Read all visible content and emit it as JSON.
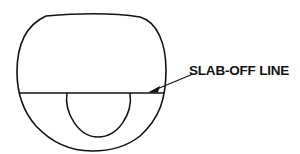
{
  "diagram": {
    "labels": {
      "slab_off_line": "SLAB-OFF LINE"
    },
    "colors": {
      "stroke": "#111111",
      "background": "#ffffff"
    },
    "elements": [
      {
        "id": "lens-outline",
        "shape": "rounded lens"
      },
      {
        "id": "slab-off-line",
        "shape": "horizontal line"
      },
      {
        "id": "bifocal-segment",
        "shape": "circle segment below line"
      },
      {
        "id": "leader-arrow",
        "shape": "arrow pointing to line"
      }
    ]
  }
}
